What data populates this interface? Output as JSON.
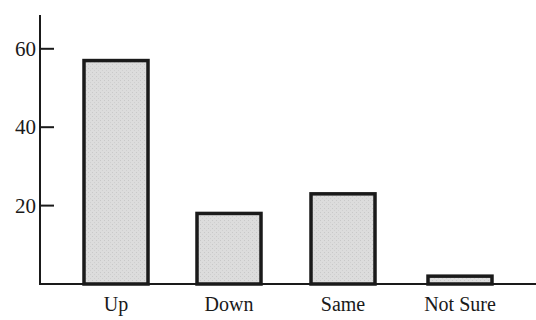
{
  "chart_data": {
    "type": "bar",
    "title": "",
    "xlabel": "",
    "ylabel": "",
    "categories": [
      "Up",
      "Down",
      "Same",
      "Not Sure"
    ],
    "values": [
      57,
      18,
      23,
      2
    ],
    "ylim": [
      0,
      68
    ],
    "yticks": [
      20,
      40,
      60
    ],
    "ytick_labels": [
      "20",
      "40",
      "60"
    ],
    "grid": false,
    "legend": null,
    "bar_fill": "#d9d9d9",
    "bar_edge": "#1a1a1a"
  }
}
